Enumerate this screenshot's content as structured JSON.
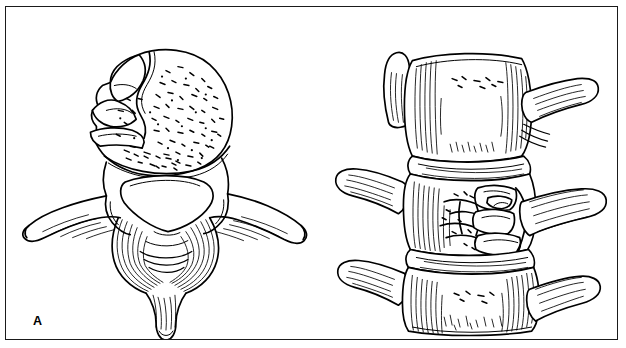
{
  "figure": {
    "kind": "medical-line-illustration",
    "background_color": "#ffffff",
    "ink_color": "#000000",
    "frame": {
      "present": true,
      "border_color": "#1a1a1a"
    },
    "panels": [
      {
        "id": "a",
        "label": "A",
        "view": "axial superior view of a burst-fractured vertebra",
        "parts": [
          "comminuted vertebral body",
          "retropulsed bone fragment",
          "trabecular bone stippling",
          "vertebral foramen",
          "left transverse process",
          "right transverse process",
          "superior articular processes",
          "laminae",
          "spinous process"
        ]
      },
      {
        "id": "b",
        "label": "B",
        "view": "lateral view of three vertebrae with middle burst fracture",
        "parts": [
          "upper intact vertebral body",
          "fractured middle vertebral body",
          "lower intact vertebral body",
          "intervertebral disc spaces",
          "transverse processes",
          "retropulsed fracture fragments"
        ]
      }
    ]
  }
}
